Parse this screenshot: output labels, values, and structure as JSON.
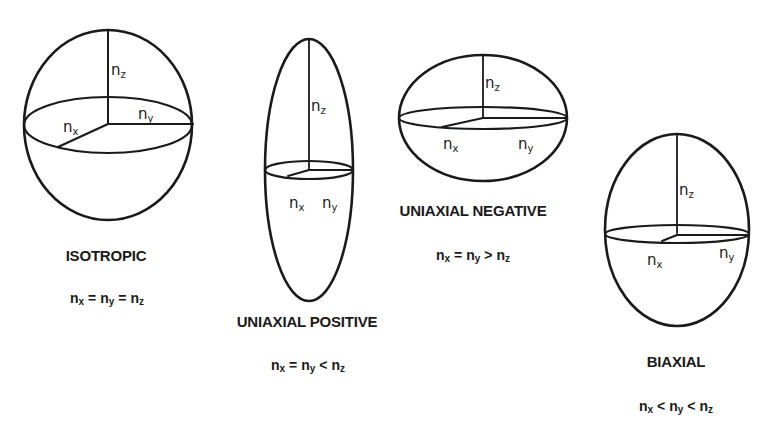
{
  "figure": {
    "stroke_color": "#1a1a1a",
    "background": "#ffffff"
  },
  "axis_labels": {
    "n": "n",
    "x": "x",
    "y": "y",
    "z": "z"
  },
  "panels": [
    {
      "id": "isotropic",
      "title": "ISOTROPIC",
      "formula": {
        "a": "n",
        "a_sub": "x",
        "op1": "=",
        "b": "n",
        "b_sub": "y",
        "op2": "=",
        "c": "n",
        "c_sub": "z"
      }
    },
    {
      "id": "uniaxial-positive",
      "title": "UNIAXIAL POSITIVE",
      "formula": {
        "a": "n",
        "a_sub": "x",
        "op1": "=",
        "b": "n",
        "b_sub": "y",
        "op2": "<",
        "c": "n",
        "c_sub": "z"
      }
    },
    {
      "id": "uniaxial-negative",
      "title": "UNIAXIAL NEGATIVE",
      "formula": {
        "a": "n",
        "a_sub": "x",
        "op1": "=",
        "b": "n",
        "b_sub": "y",
        "op2": ">",
        "c": "n",
        "c_sub": "z"
      }
    },
    {
      "id": "biaxial",
      "title": "BIAXIAL",
      "formula": {
        "a": "n",
        "a_sub": "x",
        "op1": "<",
        "b": "n",
        "b_sub": "y",
        "op2": "<",
        "c": "n",
        "c_sub": "z"
      }
    }
  ]
}
